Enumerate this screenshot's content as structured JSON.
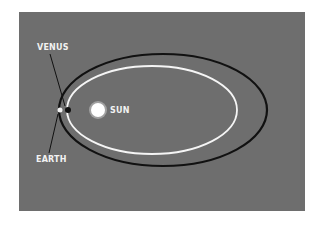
{
  "diagram": {
    "labels": {
      "venus": "VENUS",
      "sun": "SUN",
      "earth": "EARTH"
    },
    "colors": {
      "background": "#6e6e6e",
      "earth_orbit": "#111111",
      "venus_orbit": "#f5f5f5",
      "sun": "#ffffff"
    }
  }
}
